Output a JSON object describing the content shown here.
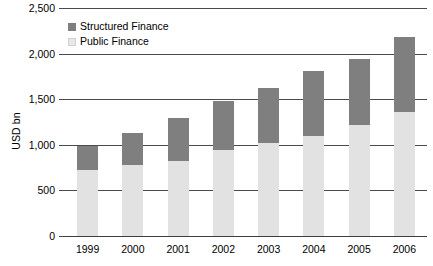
{
  "chart_data": {
    "type": "bar",
    "title": "",
    "subtitle": "",
    "xlabel": "",
    "ylabel": "USD bn",
    "ylim": [
      0,
      2500
    ],
    "ytick_values": [
      0,
      500,
      1000,
      1500,
      2000,
      2500
    ],
    "ytick_labels": [
      "0",
      "500",
      "1,000",
      "1,500",
      "2,000",
      "2,500"
    ],
    "grid": true,
    "stacked": true,
    "legend_position": "top-left-inside",
    "categories": [
      "1999",
      "2000",
      "2001",
      "2002",
      "2003",
      "2004",
      "2005",
      "2006"
    ],
    "series": [
      {
        "name": "Public Finance",
        "color": "#e2e2e2",
        "values": [
          720,
          775,
          820,
          940,
          1020,
          1100,
          1215,
          1360
        ]
      },
      {
        "name": "Structured Finance",
        "color": "#7f7f7f",
        "values": [
          270,
          360,
          470,
          540,
          600,
          710,
          730,
          820
        ]
      }
    ],
    "totals": [
      990,
      1135,
      1290,
      1480,
      1620,
      1810,
      1945,
      2180
    ]
  },
  "legend": {
    "items": [
      {
        "label": "Structured Finance",
        "swatch": "structured"
      },
      {
        "label": "Public Finance",
        "swatch": "public"
      }
    ]
  },
  "colors": {
    "structured": "#7f7f7f",
    "public": "#e2e2e2",
    "axis": "#4a4a4a",
    "text": "#000000",
    "background": "#ffffff"
  }
}
